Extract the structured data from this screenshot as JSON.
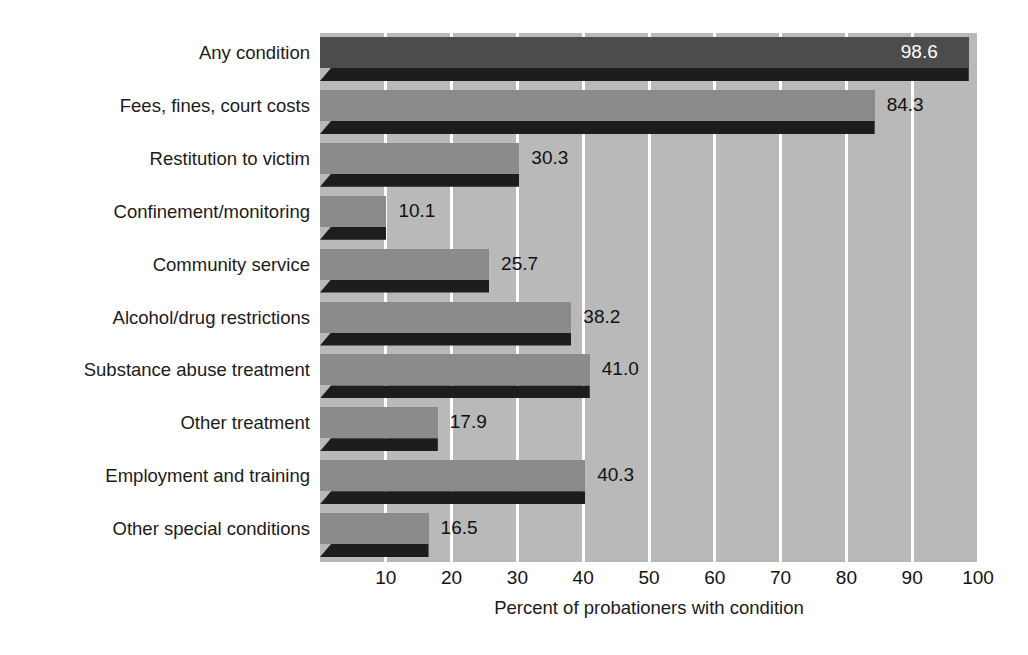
{
  "chart_data": {
    "type": "bar",
    "orientation": "horizontal",
    "title": "",
    "xlabel": "Percent of probationers with condition",
    "ylabel": "",
    "xlim": [
      0,
      100
    ],
    "xticks": [
      10,
      20,
      30,
      40,
      50,
      60,
      70,
      80,
      90,
      100
    ],
    "grid": true,
    "legend": null,
    "categories": [
      "Any condition",
      "Fees, fines, court costs",
      "Restitution to victim",
      "Confinement/monitoring",
      "Community service",
      "Alcohol/drug restrictions",
      "Substance abuse treatment",
      "Other treatment",
      "Employment and training",
      "Other special conditions"
    ],
    "values": [
      98.6,
      84.3,
      30.3,
      10.1,
      25.7,
      38.2,
      41.0,
      17.9,
      40.3,
      16.5
    ],
    "value_labels": [
      "98.6",
      "84.3",
      "30.3",
      "10.1",
      "25.7",
      "38.2",
      "41.0",
      "17.9",
      "40.3",
      "16.5"
    ],
    "label_placement": [
      "inside",
      "outside",
      "outside",
      "outside",
      "outside",
      "outside",
      "outside",
      "outside",
      "outside",
      "outside"
    ]
  },
  "style": {
    "plot_background": "#b9b9b9",
    "page_background": "#ffffff",
    "gridline_color": "#fdfdfd",
    "bar_color": "#8b8b8b",
    "bar_color_highlight": "#4c4c4c",
    "bar_shadow_color": "#1d1d1d",
    "text_color": "#1b1b1b",
    "inside_label_color": "#ffffff"
  }
}
